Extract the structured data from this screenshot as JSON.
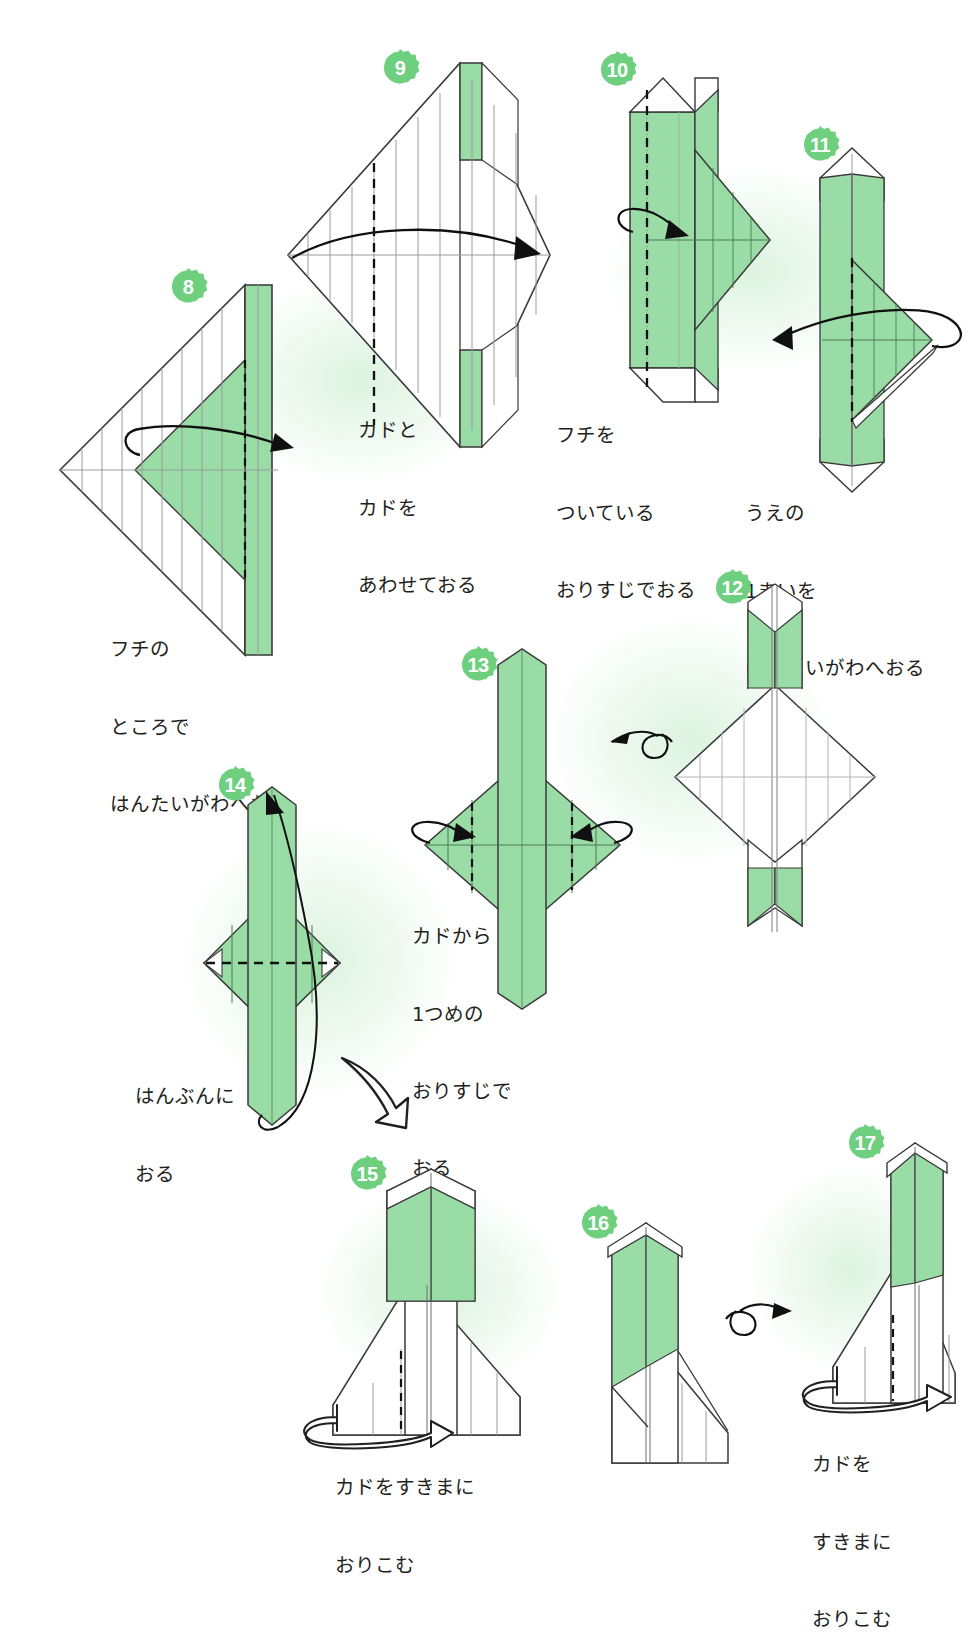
{
  "page": {
    "kind": "origami-instruction-diagram",
    "background_color": "#ffffff",
    "paper_front_color": "#9adca6",
    "paper_back_color": "#ffffff",
    "outline_color": "#3a3a3a",
    "crease_color": "#9a9a9a",
    "badge_color": "#6ecf7f",
    "badge_text_color": "#ffffff",
    "text_color": "#231f20"
  },
  "steps": [
    {
      "number": "8",
      "caption_lines": [
        "フチの",
        "ところで",
        "はんたいがわへおる"
      ],
      "symbol": "valley-fold-loop-arrow-right"
    },
    {
      "number": "9",
      "caption_lines": [
        "カドと",
        "カドを",
        "あわせておる"
      ],
      "symbol": "fold-arrow-right"
    },
    {
      "number": "10",
      "caption_lines": [
        "フチを",
        "ついている",
        "おりすじでおる"
      ],
      "symbol": "valley-fold-loop-arrow-right"
    },
    {
      "number": "11",
      "caption_lines": [
        "うえの",
        "1まいを",
        "はんたいがわへおる"
      ],
      "symbol": "fold-loop-arrow-left"
    },
    {
      "number": "12",
      "caption_lines": [],
      "symbol": "turn-over-arrow-left"
    },
    {
      "number": "13",
      "caption_lines": [
        "カドから",
        "1つめの",
        "おりすじで",
        "おる"
      ],
      "symbol": "two-inward-fold-arrows"
    },
    {
      "number": "14",
      "caption_lines": [
        "はんぶんに",
        "おる"
      ],
      "symbol": "fold-in-half-arrow-up"
    },
    {
      "number": "15",
      "caption_lines": [
        "カドをすきまに",
        "おりこむ"
      ],
      "symbol": "tuck-in-hollow-arrow"
    },
    {
      "number": "16",
      "caption_lines": [],
      "symbol": "turn-over-arrow-right"
    },
    {
      "number": "17",
      "caption_lines": [
        "カドを",
        "すきまに",
        "おりこむ"
      ],
      "symbol": "tuck-in-hollow-arrow"
    }
  ],
  "flow": {
    "step14_to_step15": "hollow-curved-arrow-down-right"
  }
}
